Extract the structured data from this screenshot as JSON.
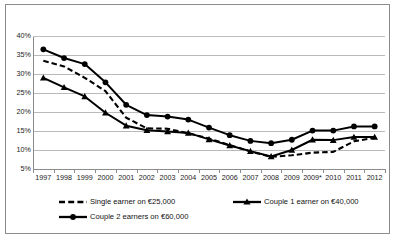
{
  "chart_data": {
    "type": "line",
    "title": "",
    "subtitle": "",
    "xlabel": "",
    "ylabel": "",
    "categories": [
      "1997",
      "1998",
      "1999",
      "2000",
      "2001",
      "2002",
      "2003",
      "2004",
      "2005",
      "2006",
      "2007",
      "2008",
      "2009",
      "2009*",
      "2010",
      "2011",
      "2012"
    ],
    "ylim": [
      5,
      40
    ],
    "ytick_labels": [
      "40%",
      "35%",
      "30%",
      "25%",
      "20%",
      "15%",
      "10%",
      "5%"
    ],
    "ytick_values": [
      40,
      35,
      30,
      25,
      20,
      15,
      10,
      5
    ],
    "grid": true,
    "legend_position": "bottom",
    "series": [
      {
        "name": "Single earner on €25,000",
        "style": "dashed",
        "marker": "none",
        "color": "#000000",
        "values": [
          33.5,
          32.0,
          29.0,
          25.5,
          18.5,
          15.7,
          15.6,
          14.4,
          13.0,
          11.3,
          9.6,
          8.2,
          8.6,
          9.3,
          9.5,
          12.3,
          13.2
        ]
      },
      {
        "name": "Couple 1 earner on €40,000",
        "style": "solid",
        "marker": "triangle",
        "color": "#000000",
        "values": [
          29.0,
          26.5,
          24.1,
          19.8,
          16.4,
          15.2,
          14.9,
          14.5,
          12.8,
          11.2,
          9.7,
          8.3,
          10.0,
          12.7,
          12.6,
          13.4,
          13.4
        ]
      },
      {
        "name": "Couple 2 earners on €60,000",
        "style": "solid",
        "marker": "circle",
        "color": "#000000",
        "values": [
          36.5,
          34.2,
          32.6,
          27.8,
          21.9,
          19.2,
          18.8,
          18.0,
          15.9,
          13.9,
          12.4,
          11.8,
          12.7,
          15.1,
          15.1,
          16.2,
          16.2
        ]
      }
    ]
  },
  "legend": {
    "items": [
      {
        "label": "Single earner on €25,000"
      },
      {
        "label": "Couple 1 earner on €40,000"
      },
      {
        "label": "Couple 2 earners on €60,000"
      }
    ]
  }
}
